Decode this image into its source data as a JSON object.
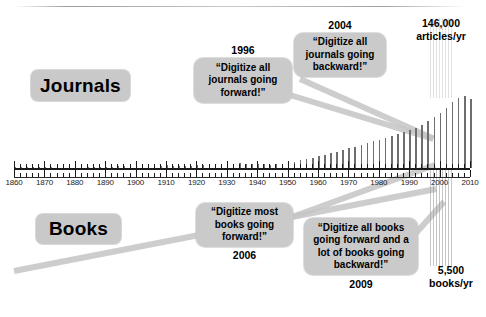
{
  "slide": {
    "categories": {
      "journals_label": "Journals",
      "books_label": "Books"
    },
    "callouts": [
      {
        "id": "journals-forward",
        "year": "1996",
        "text": "“Digitize all journals going forward!”"
      },
      {
        "id": "journals-backward",
        "year": "2004",
        "text": "“Digitize all journals going backward!”"
      },
      {
        "id": "books-forward",
        "year": "2006",
        "text": "“Digitize most books going forward!”"
      },
      {
        "id": "books-both",
        "year": "2009",
        "text": "“Digitize all books going forward and a lot of books going backward!”"
      }
    ],
    "stats": {
      "articles_value": "146,000",
      "articles_unit": "articles/yr",
      "books_value": "5,500",
      "books_unit": "books/yr"
    }
  },
  "chart_data": {
    "type": "bar",
    "title": "",
    "xlabel": "",
    "ylabel": "",
    "xlim": [
      1860,
      2010
    ],
    "ylim": [
      0,
      146000
    ],
    "grid": false,
    "legend": "none",
    "annotations": [
      "146,000 articles/yr",
      "5,500 books/yr",
      "1996 — “Digitize all journals going forward!”",
      "2004 — “Digitize all journals going backward!”",
      "2006 — “Digitize most books going forward!”",
      "2009 — “Digitize all books going forward and a lot of books going backward!”"
    ],
    "tick_labels": [
      "1860",
      "1870",
      "1880",
      "1890",
      "1900",
      "1910",
      "1920",
      "1930",
      "1940",
      "1950",
      "1960",
      "1970",
      "1980",
      "1990",
      "2000",
      "2010"
    ],
    "x": [
      1860,
      1862,
      1864,
      1866,
      1868,
      1870,
      1872,
      1874,
      1876,
      1878,
      1880,
      1882,
      1884,
      1886,
      1888,
      1890,
      1892,
      1894,
      1896,
      1898,
      1900,
      1902,
      1904,
      1906,
      1908,
      1910,
      1912,
      1914,
      1916,
      1918,
      1920,
      1922,
      1924,
      1926,
      1928,
      1930,
      1932,
      1934,
      1936,
      1938,
      1940,
      1942,
      1944,
      1946,
      1948,
      1950,
      1952,
      1954,
      1956,
      1958,
      1960,
      1962,
      1964,
      1966,
      1968,
      1970,
      1972,
      1974,
      1976,
      1978,
      1980,
      1982,
      1984,
      1986,
      1988,
      1990,
      1992,
      1994,
      1996,
      1998,
      2000,
      2002,
      2004,
      2006,
      2008,
      2010
    ],
    "values": [
      900,
      900,
      1000,
      1000,
      1100,
      1200,
      1300,
      1400,
      1500,
      1600,
      1800,
      2000,
      2100,
      2300,
      2500,
      2700,
      2900,
      3100,
      3400,
      3600,
      3900,
      4200,
      4400,
      4700,
      5000,
      5300,
      5000,
      4600,
      4300,
      4800,
      5600,
      6200,
      6800,
      7400,
      8000,
      8600,
      9000,
      9400,
      9000,
      8400,
      8000,
      7400,
      7000,
      7800,
      9000,
      11000,
      13000,
      15500,
      18000,
      21000,
      24000,
      27000,
      30000,
      33000,
      36500,
      40000,
      43500,
      47000,
      50500,
      54000,
      57500,
      61000,
      64500,
      68500,
      72500,
      77000,
      82000,
      88000,
      95000,
      103000,
      112000,
      122000,
      133000,
      142000,
      146000,
      140000
    ]
  }
}
